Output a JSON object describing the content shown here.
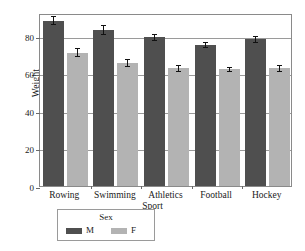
{
  "chart_data": {
    "type": "bar",
    "title": "",
    "xlabel": "Sport",
    "ylabel": "Weight",
    "categories": [
      "Rowing",
      "Swimming",
      "Athletics",
      "Football",
      "Hockey"
    ],
    "series": [
      {
        "name": "M",
        "color": "#4f4f4f",
        "values": [
          88,
          83,
          79,
          75,
          78
        ],
        "errors": [
          2.5,
          2.5,
          2.0,
          1.5,
          2.0
        ]
      },
      {
        "name": "F",
        "color": "#b3b3b3",
        "values": [
          71,
          65.5,
          62.5,
          62,
          62.5
        ],
        "errors": [
          2.5,
          2.0,
          2.0,
          1.5,
          2.0
        ]
      }
    ],
    "ylim": [
      0,
      92
    ],
    "yticks": [
      0,
      20,
      40,
      60,
      80
    ],
    "ytick_labels": [
      "0",
      "20",
      "40",
      "60",
      "80"
    ],
    "grid": true,
    "legend": {
      "title": "Sex",
      "position": "below-left",
      "entries": [
        "M",
        "F"
      ]
    }
  },
  "axes": {
    "ylabel": "Weight",
    "xlabel": "Sport"
  },
  "legend": {
    "title": "Sex",
    "entries": [
      {
        "label": "M",
        "color": "#4f4f4f"
      },
      {
        "label": "F",
        "color": "#b3b3b3"
      }
    ]
  },
  "yticks": [
    {
      "label": "80",
      "value": 80
    },
    {
      "label": "60",
      "value": 60
    },
    {
      "label": "40",
      "value": 40
    },
    {
      "label": "20",
      "value": 20
    },
    {
      "label": "0",
      "value": 0
    }
  ],
  "xticks": [
    {
      "label": "Rowing"
    },
    {
      "label": "Swimming"
    },
    {
      "label": "Athletics"
    },
    {
      "label": "Football"
    },
    {
      "label": "Hockey"
    }
  ]
}
